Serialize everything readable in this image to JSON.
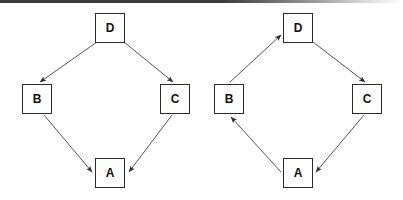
{
  "figure": {
    "background_color": "#ffffff",
    "stroke_color": "#2b2b2b",
    "edge_color": "#555555",
    "top_rule_color": "#3a3a3a",
    "width": 403,
    "height": 200
  },
  "diagrams": [
    {
      "id": "left-diagram",
      "name": "divergent-convergent-graph",
      "nodes": [
        {
          "id": "D",
          "label": "D",
          "x": 95,
          "y": 13
        },
        {
          "id": "B",
          "label": "B",
          "x": 22,
          "y": 84
        },
        {
          "id": "C",
          "label": "C",
          "x": 160,
          "y": 84
        },
        {
          "id": "A",
          "label": "A",
          "x": 95,
          "y": 158
        }
      ],
      "edges": [
        {
          "id": "left-D-B",
          "from": "D",
          "to": "B",
          "label": "D to B",
          "x1": 97,
          "y1": 42,
          "x2": 40,
          "y2": 82
        },
        {
          "id": "left-D-C",
          "from": "D",
          "to": "C",
          "label": "D to C",
          "x1": 124,
          "y1": 42,
          "x2": 173,
          "y2": 82
        },
        {
          "id": "left-B-A",
          "from": "B",
          "to": "A",
          "label": "B to A",
          "x1": 44,
          "y1": 115,
          "x2": 92,
          "y2": 172
        },
        {
          "id": "left-C-A",
          "from": "C",
          "to": "A",
          "label": "C to A",
          "x1": 172,
          "y1": 115,
          "x2": 129,
          "y2": 172
        }
      ]
    },
    {
      "id": "right-diagram",
      "name": "cyclic-graph",
      "nodes": [
        {
          "id": "D",
          "label": "D",
          "x": 283,
          "y": 13
        },
        {
          "id": "B",
          "label": "B",
          "x": 214,
          "y": 84
        },
        {
          "id": "C",
          "label": "C",
          "x": 352,
          "y": 84
        },
        {
          "id": "A",
          "label": "A",
          "x": 283,
          "y": 158
        }
      ],
      "edges": [
        {
          "id": "right-B-D",
          "from": "B",
          "to": "D",
          "label": "B to D",
          "x1": 230,
          "y1": 82,
          "x2": 281,
          "y2": 35
        },
        {
          "id": "right-D-C",
          "from": "D",
          "to": "C",
          "label": "D to C",
          "x1": 313,
          "y1": 42,
          "x2": 365,
          "y2": 82
        },
        {
          "id": "right-C-A",
          "from": "C",
          "to": "A",
          "label": "C to A",
          "x1": 364,
          "y1": 115,
          "x2": 316,
          "y2": 172
        },
        {
          "id": "right-A-B",
          "from": "A",
          "to": "B",
          "label": "A to B",
          "x1": 281,
          "y1": 172,
          "x2": 231,
          "y2": 117
        }
      ]
    }
  ]
}
